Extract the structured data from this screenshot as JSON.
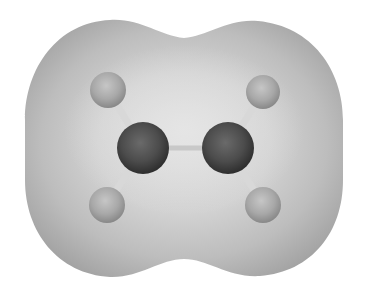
{
  "figure": {
    "background_color": "#ffffff",
    "surface": {
      "edge_color": "#a4a4a4",
      "mid_color": "#bcbcbc",
      "inner_color": "#d6d6d6",
      "highlight_color": "#e2e2e2"
    },
    "atoms": [
      {
        "element": "C",
        "label": "carbon-left",
        "cx": 143,
        "cy": 148,
        "r": 26,
        "color": "#4e4e4e",
        "shade": "#2e2e2e",
        "light": "#6a6a6a"
      },
      {
        "element": "C",
        "label": "carbon-right",
        "cx": 228,
        "cy": 148,
        "r": 26,
        "color": "#4e4e4e",
        "shade": "#2e2e2e",
        "light": "#6a6a6a"
      },
      {
        "element": "H",
        "label": "hydrogen-top-left",
        "cx": 108,
        "cy": 90,
        "r": 18,
        "color": "#a6a6a6",
        "shade": "#8a8a8a",
        "light": "#c4c4c4"
      },
      {
        "element": "H",
        "label": "hydrogen-top-right",
        "cx": 263,
        "cy": 92,
        "r": 17,
        "color": "#a6a6a6",
        "shade": "#8a8a8a",
        "light": "#c4c4c4"
      },
      {
        "element": "H",
        "label": "hydrogen-bottom-left",
        "cx": 107,
        "cy": 205,
        "r": 18,
        "color": "#a6a6a6",
        "shade": "#8a8a8a",
        "light": "#c4c4c4"
      },
      {
        "element": "H",
        "label": "hydrogen-bottom-right",
        "cx": 263,
        "cy": 205,
        "r": 18,
        "color": "#a6a6a6",
        "shade": "#8a8a8a",
        "light": "#c4c4c4"
      }
    ],
    "bonds": [
      {
        "from": 0,
        "to": 1,
        "color": "#c8c8c8"
      },
      {
        "from": 0,
        "to": 2,
        "color": "#d8d8d8"
      },
      {
        "from": 0,
        "to": 4,
        "color": "#d8d8d8"
      },
      {
        "from": 1,
        "to": 3,
        "color": "#d8d8d8"
      },
      {
        "from": 1,
        "to": 5,
        "color": "#d8d8d8"
      }
    ]
  }
}
